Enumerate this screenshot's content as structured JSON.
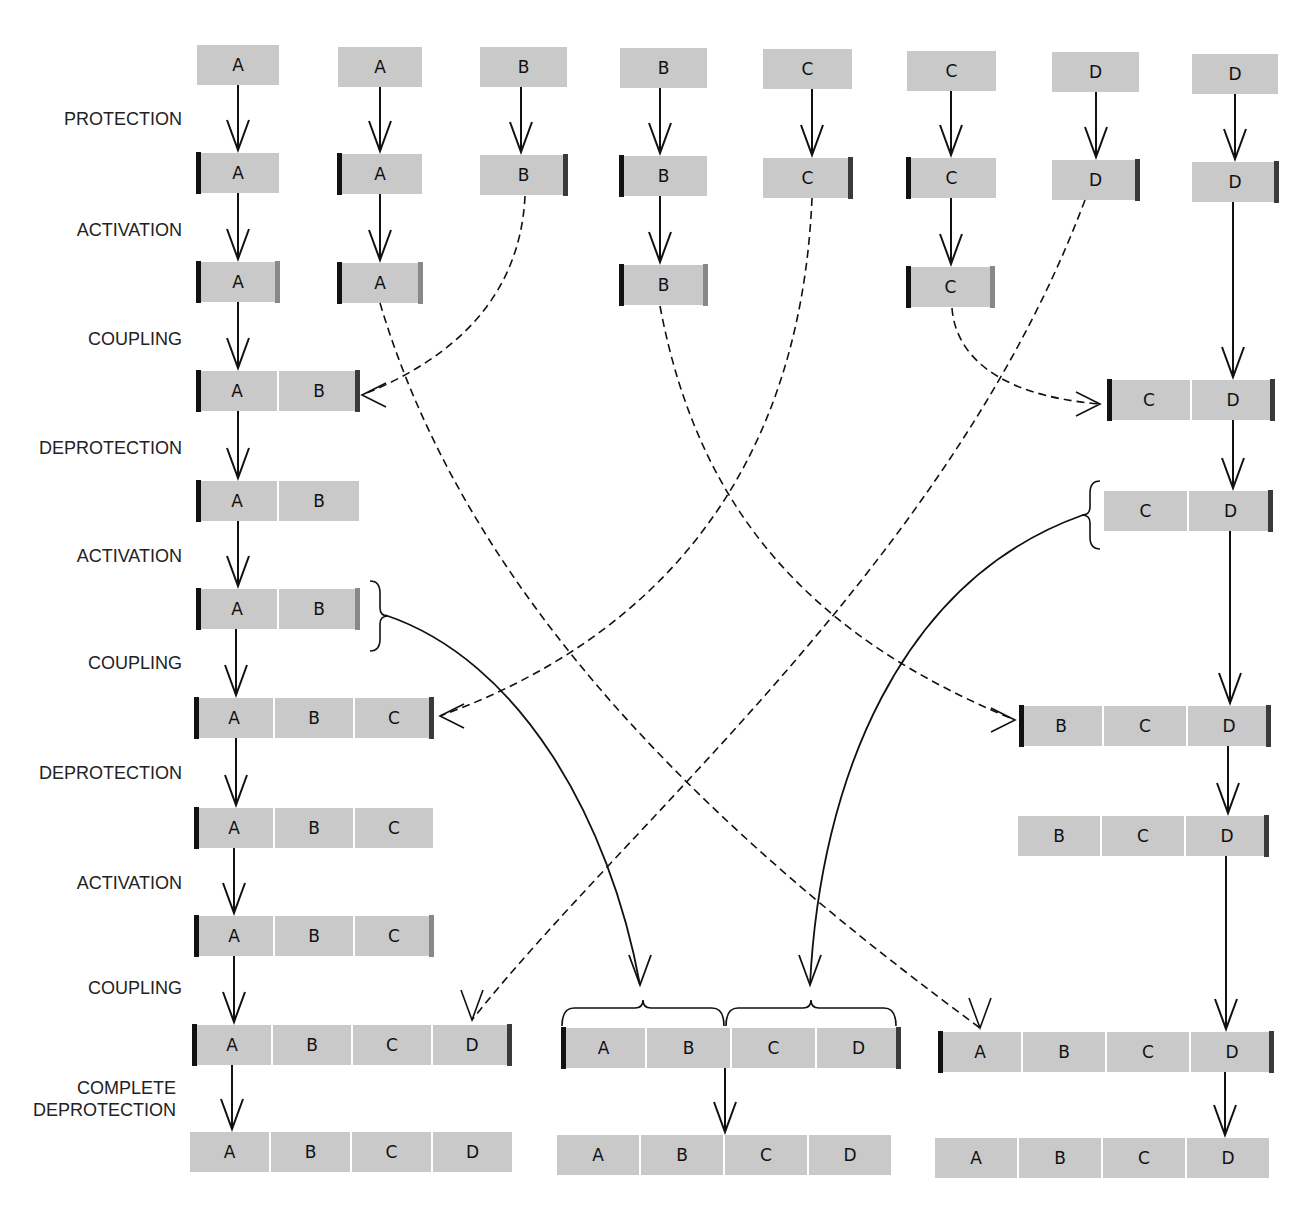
{
  "colors": {
    "box": "#c9c9c9",
    "n_protect_bar": "#111111",
    "c_protect_bar": "#3a3a3a",
    "activation_bar": "#888888",
    "line": "#111111"
  },
  "step_labels": [
    {
      "text": "PROTECTION",
      "x": 182,
      "y": 108
    },
    {
      "text": "ACTIVATION",
      "x": 182,
      "y": 219
    },
    {
      "text": "COUPLING",
      "x": 182,
      "y": 328
    },
    {
      "text": "DEPROTECTION",
      "x": 182,
      "y": 437
    },
    {
      "text": "ACTIVATION",
      "x": 182,
      "y": 545
    },
    {
      "text": "COUPLING",
      "x": 182,
      "y": 652
    },
    {
      "text": "DEPROTECTION",
      "x": 182,
      "y": 762
    },
    {
      "text": "ACTIVATION",
      "x": 182,
      "y": 872
    },
    {
      "text": "COUPLING",
      "x": 182,
      "y": 977
    },
    {
      "text": "COMPLETE",
      "x": 176,
      "y": 1077
    },
    {
      "text": "DEPROTECTION",
      "x": 176,
      "y": 1099
    }
  ],
  "chains": [
    {
      "x": 197,
      "y": 45,
      "units": [
        "A"
      ],
      "w": 82,
      "l": null,
      "r": null
    },
    {
      "x": 338,
      "y": 47,
      "units": [
        "A"
      ],
      "w": 84,
      "l": null,
      "r": null
    },
    {
      "x": 480,
      "y": 47,
      "units": [
        "B"
      ],
      "w": 87,
      "l": null,
      "r": null
    },
    {
      "x": 620,
      "y": 48,
      "units": [
        "B"
      ],
      "w": 87,
      "l": null,
      "r": null
    },
    {
      "x": 763,
      "y": 49,
      "units": [
        "C"
      ],
      "w": 89,
      "l": null,
      "r": null
    },
    {
      "x": 907,
      "y": 51,
      "units": [
        "C"
      ],
      "w": 89,
      "l": null,
      "r": null
    },
    {
      "x": 1052,
      "y": 52,
      "units": [
        "D"
      ],
      "w": 87,
      "l": null,
      "r": null
    },
    {
      "x": 1192,
      "y": 54,
      "units": [
        "D"
      ],
      "w": 86,
      "l": null,
      "r": null
    },
    {
      "x": 197,
      "y": 153,
      "units": [
        "A"
      ],
      "w": 82,
      "l": "prot-l",
      "r": null
    },
    {
      "x": 338,
      "y": 154,
      "units": [
        "A"
      ],
      "w": 84,
      "l": "prot-l",
      "r": null
    },
    {
      "x": 480,
      "y": 155,
      "units": [
        "B"
      ],
      "w": 87,
      "l": null,
      "r": "prot-r"
    },
    {
      "x": 620,
      "y": 156,
      "units": [
        "B"
      ],
      "w": 87,
      "l": "prot-l",
      "r": null
    },
    {
      "x": 763,
      "y": 158,
      "units": [
        "C"
      ],
      "w": 89,
      "l": null,
      "r": "prot-r"
    },
    {
      "x": 907,
      "y": 158,
      "units": [
        "C"
      ],
      "w": 89,
      "l": "prot-l",
      "r": null
    },
    {
      "x": 1052,
      "y": 160,
      "units": [
        "D"
      ],
      "w": 87,
      "l": null,
      "r": "prot-r"
    },
    {
      "x": 1192,
      "y": 162,
      "units": [
        "D"
      ],
      "w": 86,
      "l": null,
      "r": "prot-r"
    },
    {
      "x": 197,
      "y": 262,
      "units": [
        "A"
      ],
      "w": 82,
      "l": "prot-l",
      "r": "act"
    },
    {
      "x": 338,
      "y": 263,
      "units": [
        "A"
      ],
      "w": 84,
      "l": "prot-l",
      "r": "act"
    },
    {
      "x": 620,
      "y": 265,
      "units": [
        "B"
      ],
      "w": 87,
      "l": "prot-l",
      "r": "act"
    },
    {
      "x": 907,
      "y": 267,
      "units": [
        "C"
      ],
      "w": 87,
      "l": "prot-l",
      "r": "act"
    },
    {
      "x": 197,
      "y": 371,
      "units": [
        "A",
        "B"
      ],
      "w": 80,
      "l": "prot-l",
      "r": "prot-r"
    },
    {
      "x": 1108,
      "y": 380,
      "units": [
        "C",
        "D"
      ],
      "w": 82,
      "l": "prot-l",
      "r": "prot-r"
    },
    {
      "x": 197,
      "y": 481,
      "units": [
        "A",
        "B"
      ],
      "w": 80,
      "l": "prot-l",
      "r": null
    },
    {
      "x": 1104,
      "y": 491,
      "units": [
        "C",
        "D"
      ],
      "w": 83,
      "l": null,
      "r": "prot-r"
    },
    {
      "x": 197,
      "y": 589,
      "units": [
        "A",
        "B"
      ],
      "w": 80,
      "l": "prot-l",
      "r": "act"
    },
    {
      "x": 195,
      "y": 698,
      "units": [
        "A",
        "B",
        "C"
      ],
      "w": 78,
      "l": "prot-l",
      "r": "prot-r"
    },
    {
      "x": 1020,
      "y": 706,
      "units": [
        "B",
        "C",
        "D"
      ],
      "w": 82,
      "l": "prot-l",
      "r": "prot-r"
    },
    {
      "x": 195,
      "y": 808,
      "units": [
        "A",
        "B",
        "C"
      ],
      "w": 78,
      "l": "prot-l",
      "r": null
    },
    {
      "x": 1018,
      "y": 816,
      "units": [
        "B",
        "C",
        "D"
      ],
      "w": 82,
      "l": null,
      "r": "prot-r"
    },
    {
      "x": 195,
      "y": 916,
      "units": [
        "A",
        "B",
        "C"
      ],
      "w": 78,
      "l": "prot-l",
      "r": "act"
    },
    {
      "x": 193,
      "y": 1025,
      "units": [
        "A",
        "B",
        "C",
        "D"
      ],
      "w": 78,
      "l": "prot-l",
      "r": "prot-r"
    },
    {
      "x": 562,
      "y": 1028,
      "units": [
        "A",
        "B",
        "C",
        "D"
      ],
      "w": 83,
      "l": "prot-l",
      "r": "prot-r"
    },
    {
      "x": 939,
      "y": 1032,
      "units": [
        "A",
        "B",
        "C",
        "D"
      ],
      "w": 82,
      "l": "prot-l",
      "r": "prot-r"
    },
    {
      "x": 190,
      "y": 1132,
      "units": [
        "A",
        "B",
        "C",
        "D"
      ],
      "w": 79,
      "l": null,
      "r": null
    },
    {
      "x": 557,
      "y": 1135,
      "units": [
        "A",
        "B",
        "C",
        "D"
      ],
      "w": 82,
      "l": null,
      "r": null
    },
    {
      "x": 935,
      "y": 1138,
      "units": [
        "A",
        "B",
        "C",
        "D"
      ],
      "w": 82,
      "l": null,
      "r": null
    }
  ],
  "solid_arrows": [
    [
      238,
      85,
      238,
      150
    ],
    [
      380,
      87,
      380,
      151
    ],
    [
      521,
      87,
      521,
      152
    ],
    [
      660,
      88,
      660,
      153
    ],
    [
      812,
      89,
      812,
      155
    ],
    [
      951,
      91,
      951,
      155
    ],
    [
      1096,
      92,
      1096,
      157
    ],
    [
      1235,
      94,
      1235,
      159
    ],
    [
      238,
      193,
      238,
      259
    ],
    [
      380,
      194,
      380,
      260
    ],
    [
      660,
      196,
      660,
      262
    ],
    [
      951,
      198,
      951,
      264
    ],
    [
      238,
      302,
      238,
      368
    ],
    [
      1233,
      202,
      1233,
      377
    ],
    [
      238,
      411,
      238,
      478
    ],
    [
      1233,
      420,
      1233,
      488
    ],
    [
      238,
      521,
      238,
      586
    ],
    [
      236,
      629,
      236,
      695
    ],
    [
      1230,
      531,
      1230,
      703
    ],
    [
      236,
      738,
      236,
      805
    ],
    [
      1228,
      746,
      1228,
      813
    ],
    [
      234,
      848,
      234,
      913
    ],
    [
      1226,
      856,
      1226,
      1029
    ],
    [
      234,
      956,
      234,
      1022
    ],
    [
      232,
      1065,
      232,
      1129
    ],
    [
      725,
      1068,
      725,
      1132
    ],
    [
      1225,
      1072,
      1225,
      1135
    ]
  ],
  "dashed_curves": [
    {
      "d": "M525,196 C520,300 450,360 362,395",
      "arrow": "left"
    },
    {
      "d": "M812,198 C800,480 650,640 440,716",
      "arrow": "left"
    },
    {
      "d": "M1085,200 C950,560 630,820 472,1020",
      "arrow": "down"
    },
    {
      "d": "M952,308 C955,350 990,395 1100,404",
      "arrow": "right"
    },
    {
      "d": "M380,303 C480,640 780,880 980,1028",
      "arrow": "down"
    },
    {
      "d": "M660,306 C700,520 820,640 1015,720",
      "arrow": "right"
    }
  ],
  "solid_curves": [
    {
      "d": "M385,615 C520,660 610,820 640,985",
      "arrow": "down"
    },
    {
      "d": "M1083,515 C900,580 820,780 810,985",
      "arrow": "down"
    }
  ],
  "braces": [
    {
      "type": "right",
      "x": 370,
      "y1": 581,
      "y2": 651
    },
    {
      "type": "left",
      "x": 1100,
      "y1": 481,
      "y2": 549
    },
    {
      "type": "top",
      "y": 1008,
      "x1": 562,
      "x2": 724
    },
    {
      "type": "top",
      "y": 1008,
      "x1": 726,
      "x2": 896
    }
  ]
}
